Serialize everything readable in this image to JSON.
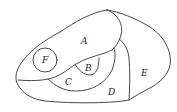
{
  "diagram": {
    "type": "region-map",
    "stroke_color": "#333333",
    "background": "#ffffff",
    "regions": [
      {
        "id": "A",
        "label": "A",
        "x": 84,
        "y": 43
      },
      {
        "id": "B",
        "label": "B",
        "x": 87,
        "y": 71
      },
      {
        "id": "C",
        "label": "C",
        "x": 68,
        "y": 85
      },
      {
        "id": "D",
        "label": "D",
        "x": 112,
        "y": 95
      },
      {
        "id": "E",
        "label": "E",
        "x": 144,
        "y": 76
      },
      {
        "id": "F",
        "label": "F",
        "x": 45,
        "y": 61
      }
    ]
  }
}
